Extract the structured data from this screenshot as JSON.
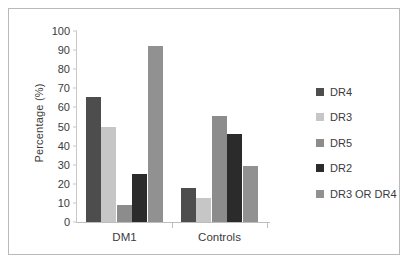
{
  "figure": {
    "background": "#ffffff",
    "border_color": "#b9b9b9"
  },
  "chart_data": {
    "type": "bar",
    "title": "",
    "subtitle": "",
    "xlabel": "",
    "ylabel": "Percentage (%)",
    "categories": [
      "DM1",
      "Controls"
    ],
    "ylim": [
      0,
      100
    ],
    "yticks": [
      0,
      10,
      20,
      30,
      40,
      50,
      60,
      70,
      80,
      90,
      100
    ],
    "ytick_labels": [
      "0",
      "10",
      "20",
      "30",
      "40",
      "50",
      "60",
      "70",
      "80",
      "90",
      "100"
    ],
    "grid": false,
    "legend_position": "right",
    "series": [
      {
        "name": "DR4",
        "color": "#4d4d4d",
        "values": [
          65.5,
          18.0
        ]
      },
      {
        "name": "DR3",
        "color": "#c6c6c6",
        "values": [
          50.0,
          12.5
        ]
      },
      {
        "name": "DR5",
        "color": "#8c8c8c",
        "values": [
          9.0,
          55.5
        ]
      },
      {
        "name": "DR2",
        "color": "#2b2b2b",
        "values": [
          25.0,
          46.0
        ]
      },
      {
        "name": "DR3 OR DR4",
        "color": "#919191",
        "values": [
          92.0,
          29.5
        ]
      }
    ]
  }
}
